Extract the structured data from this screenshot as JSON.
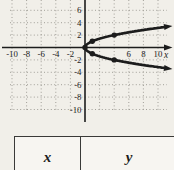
{
  "page": {
    "background": "#f1efe9",
    "ink": "#1c1c1c",
    "grid_color": "#98968f",
    "table_background": "#f7f5f1",
    "table_border": "#3a3a38"
  },
  "chart_data": {
    "type": "line",
    "title": "",
    "curve": "x = y^2 (sideways parabola opening to the right, vertex at the origin, arrowheads on both branches)",
    "points": [
      [
        0,
        0
      ],
      [
        1,
        1
      ],
      [
        1,
        -1
      ],
      [
        4,
        2
      ],
      [
        4,
        -2
      ]
    ],
    "xlabel": "x",
    "ylabel": "",
    "x_ticks": [
      -10,
      -8,
      -6,
      -4,
      -2,
      6,
      8,
      10
    ],
    "y_ticks": [
      6,
      4,
      2,
      -2,
      -4,
      -6,
      -8,
      -10
    ],
    "xlim": [
      -10.5,
      11.5
    ],
    "ylim": [
      -10.5,
      7.5
    ],
    "grid": {
      "style": "dotted",
      "step": 2,
      "x_range": [
        -10,
        10
      ],
      "y_range": [
        -10,
        6
      ]
    },
    "curve_y_extent": 3.32,
    "legend": "none"
  },
  "table": {
    "headers": [
      "x",
      "y"
    ],
    "rows": []
  }
}
